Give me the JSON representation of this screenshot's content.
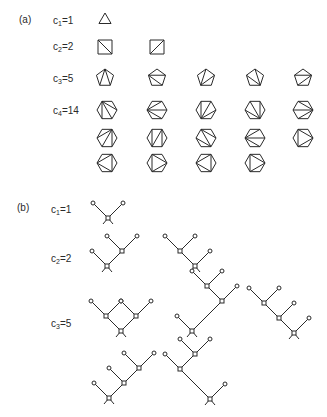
{
  "panel_a": {
    "label": "(a)",
    "rows": [
      {
        "c_label": "c",
        "sub": "1",
        "value": "=1",
        "n": 3,
        "count": 1
      },
      {
        "c_label": "c",
        "sub": "2",
        "value": "=2",
        "n": 4,
        "count": 2
      },
      {
        "c_label": "c",
        "sub": "3",
        "value": "=5",
        "n": 5,
        "count": 5
      },
      {
        "c_label": "c",
        "sub": "4",
        "value": "=14",
        "n": 6,
        "count": 14
      }
    ]
  },
  "panel_b": {
    "label": "(b)",
    "rows": [
      {
        "c_label": "c",
        "sub": "1",
        "value": "=1",
        "count": 1
      },
      {
        "c_label": "c",
        "sub": "2",
        "value": "=2",
        "count": 2
      },
      {
        "c_label": "c",
        "sub": "3",
        "value": "=5",
        "count": 5
      }
    ]
  },
  "colors": {
    "ink": "#2a2a2a",
    "background": "#ffffff"
  }
}
